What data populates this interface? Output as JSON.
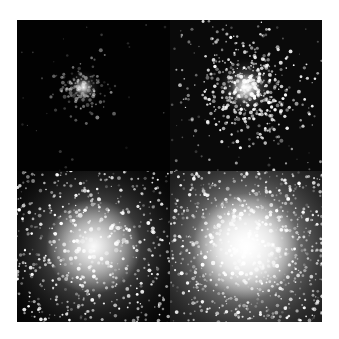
{
  "figure": {
    "layout": "2x2 grid",
    "panels": [
      {
        "position": "top-left",
        "subject": "globular-star-cluster",
        "brightness": "faint",
        "core_radius": 6,
        "star_count": 120,
        "bg": "#020202",
        "seed": 11
      },
      {
        "position": "top-right",
        "subject": "globular-star-cluster",
        "brightness": "medium",
        "core_radius": 10,
        "star_count": 420,
        "bg": "#0a0a0a",
        "seed": 23
      },
      {
        "position": "bottom-left",
        "subject": "globular-star-cluster",
        "brightness": "bright",
        "core_radius": 34,
        "star_count": 900,
        "bg": "#050505",
        "seed": 37
      },
      {
        "position": "bottom-right",
        "subject": "globular-star-cluster",
        "brightness": "saturated",
        "core_radius": 38,
        "star_count": 1400,
        "bg": "#1a1a1a",
        "seed": 53
      }
    ]
  }
}
